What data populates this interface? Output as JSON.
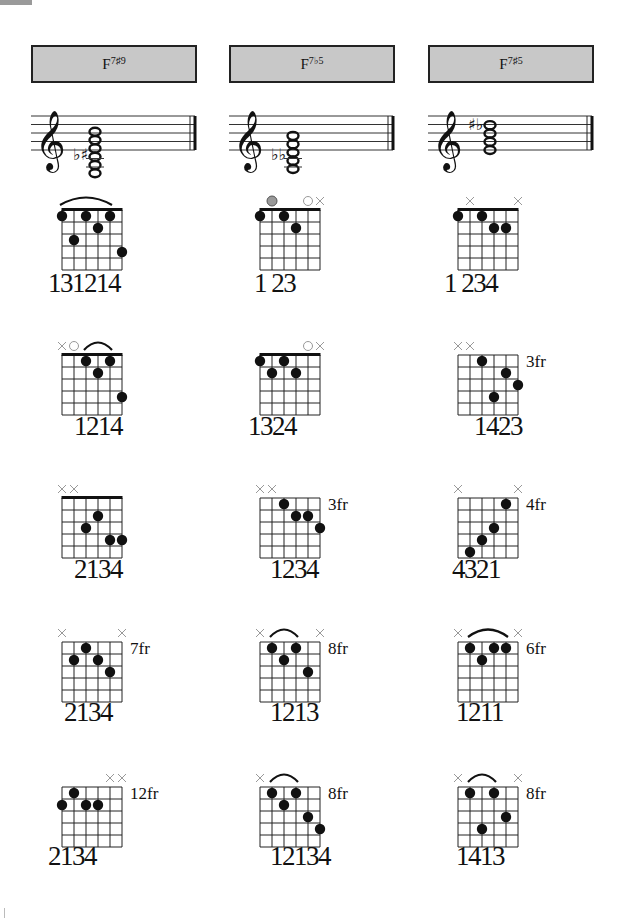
{
  "page": {
    "corner_tab_color": "#9a9a9a"
  },
  "columns": [
    {
      "chord": {
        "root": "F",
        "ext": "7♯9"
      },
      "staff": {
        "accidentals": "♭♯",
        "notes": 6,
        "clef": "treble"
      },
      "diagrams": [
        {
          "fret_label": "",
          "nut": true,
          "markers": [
            "",
            "",
            "",
            "",
            "",
            ""
          ],
          "optional": [],
          "barre": [
            1,
            5
          ],
          "dots": [
            [
              1,
              1
            ],
            [
              2,
              3
            ],
            [
              3,
              1
            ],
            [
              4,
              2
            ],
            [
              5,
              1
            ],
            [
              6,
              4
            ]
          ],
          "fingering": "131214"
        },
        {
          "fret_label": "",
          "nut": true,
          "markers": [
            "x",
            "o",
            "",
            "",
            "",
            ""
          ],
          "optional": [],
          "barre": [
            3,
            5
          ],
          "dots": [
            [
              3,
              1
            ],
            [
              4,
              2
            ],
            [
              5,
              1
            ],
            [
              6,
              4
            ]
          ],
          "fingering": "1214"
        },
        {
          "fret_label": "",
          "nut": true,
          "markers": [
            "x",
            "x",
            "",
            "",
            "",
            ""
          ],
          "optional": [],
          "barre": null,
          "dots": [
            [
              3,
              3
            ],
            [
              4,
              2
            ],
            [
              5,
              4
            ],
            [
              6,
              4
            ]
          ],
          "fingering": "2134"
        },
        {
          "fret_label": "7fr",
          "nut": false,
          "markers": [
            "x",
            "",
            "",
            "",
            "",
            "x"
          ],
          "optional": [],
          "barre": null,
          "dots": [
            [
              2,
              2
            ],
            [
              3,
              1
            ],
            [
              4,
              2
            ],
            [
              5,
              3
            ]
          ],
          "fingering": "2134"
        },
        {
          "fret_label": "12fr",
          "nut": false,
          "markers": [
            "",
            "",
            "",
            "",
            "x",
            "x"
          ],
          "optional": [],
          "barre": null,
          "dots": [
            [
              1,
              2
            ],
            [
              2,
              1
            ],
            [
              3,
              2
            ],
            [
              4,
              2
            ]
          ],
          "fingering": "2134"
        }
      ]
    },
    {
      "chord": {
        "root": "F",
        "ext": "7♭5"
      },
      "staff": {
        "accidentals": "♭♭",
        "notes": 5,
        "clef": "treble"
      },
      "diagrams": [
        {
          "fret_label": "",
          "nut": true,
          "markers": [
            "",
            "",
            "",
            "",
            "o",
            "x"
          ],
          "optional": [
            2
          ],
          "barre": null,
          "dots": [
            [
              1,
              1
            ],
            [
              3,
              1
            ],
            [
              4,
              2
            ]
          ],
          "fingering": "1 23"
        },
        {
          "fret_label": "",
          "nut": true,
          "markers": [
            "",
            "",
            "",
            "",
            "o",
            "x"
          ],
          "optional": [],
          "barre": null,
          "dots": [
            [
              1,
              1
            ],
            [
              2,
              2
            ],
            [
              3,
              1
            ],
            [
              4,
              2
            ]
          ],
          "fingering": "1324"
        },
        {
          "fret_label": "3fr",
          "nut": false,
          "markers": [
            "x",
            "x",
            "",
            "",
            "",
            ""
          ],
          "optional": [],
          "barre": null,
          "dots": [
            [
              3,
              1
            ],
            [
              4,
              2
            ],
            [
              5,
              2
            ],
            [
              6,
              3
            ]
          ],
          "fingering": "1234"
        },
        {
          "fret_label": "8fr",
          "nut": false,
          "markers": [
            "x",
            "",
            "",
            "",
            "",
            "x"
          ],
          "optional": [],
          "barre": [
            2,
            4
          ],
          "dots": [
            [
              2,
              1
            ],
            [
              3,
              2
            ],
            [
              4,
              1
            ],
            [
              5,
              3
            ]
          ],
          "fingering": "1213"
        },
        {
          "fret_label": "8fr",
          "nut": false,
          "markers": [
            "x",
            "",
            "",
            "",
            "",
            ""
          ],
          "optional": [],
          "barre": [
            2,
            4
          ],
          "dots": [
            [
              2,
              1
            ],
            [
              3,
              2
            ],
            [
              4,
              1
            ],
            [
              5,
              3
            ],
            [
              6,
              4
            ]
          ],
          "fingering": "12134"
        }
      ]
    },
    {
      "chord": {
        "root": "F",
        "ext": "7♯5"
      },
      "staff": {
        "accidentals": "♯♭",
        "notes": 4,
        "clef": "treble"
      },
      "diagrams": [
        {
          "fret_label": "",
          "nut": true,
          "markers": [
            "",
            "x",
            "",
            "",
            "",
            "x"
          ],
          "optional": [],
          "barre": null,
          "dots": [
            [
              1,
              1
            ],
            [
              3,
              1
            ],
            [
              4,
              2
            ],
            [
              5,
              2
            ]
          ],
          "fingering": "1 234"
        },
        {
          "fret_label": "3fr",
          "nut": false,
          "markers": [
            "x",
            "x",
            "",
            "",
            "",
            ""
          ],
          "optional": [],
          "barre": null,
          "dots": [
            [
              3,
              1
            ],
            [
              4,
              4
            ],
            [
              5,
              2
            ],
            [
              6,
              3
            ]
          ],
          "fingering": "1423"
        },
        {
          "fret_label": "4fr",
          "nut": false,
          "markers": [
            "x",
            "",
            "",
            "",
            "",
            "x"
          ],
          "optional": [],
          "barre": null,
          "dots": [
            [
              2,
              5
            ],
            [
              3,
              4
            ],
            [
              4,
              3
            ],
            [
              5,
              1
            ]
          ],
          "fingering": "4321"
        },
        {
          "fret_label": "6fr",
          "nut": false,
          "markers": [
            "x",
            "",
            "",
            "",
            "",
            "x"
          ],
          "optional": [],
          "barre": [
            2,
            5
          ],
          "dots": [
            [
              2,
              1
            ],
            [
              3,
              2
            ],
            [
              4,
              1
            ],
            [
              5,
              1
            ]
          ],
          "fingering": "1211"
        },
        {
          "fret_label": "8fr",
          "nut": false,
          "markers": [
            "x",
            "",
            "",
            "",
            "",
            "x"
          ],
          "optional": [],
          "barre": [
            2,
            4
          ],
          "dots": [
            [
              2,
              1
            ],
            [
              3,
              4
            ],
            [
              4,
              1
            ],
            [
              5,
              3
            ]
          ],
          "fingering": "1413"
        }
      ]
    }
  ]
}
